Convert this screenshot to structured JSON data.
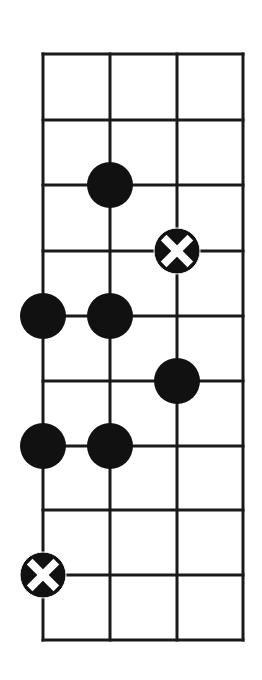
{
  "diagram": {
    "type": "fretboard-scale-diagram",
    "strings": 4,
    "frets": 9,
    "grid": {
      "x_lines": [
        43,
        110,
        177,
        243
      ],
      "y_lines": [
        54,
        120,
        185,
        251,
        316,
        381,
        446,
        510,
        575,
        640
      ],
      "line_color": "#1a1a1a",
      "line_width": 3
    },
    "dot_radius": 23,
    "dot_color": "#111111",
    "marks": [
      {
        "string": 1,
        "line": 2,
        "kind": "filled"
      },
      {
        "string": 2,
        "line": 3,
        "kind": "root-x"
      },
      {
        "string": 0,
        "line": 4,
        "kind": "filled"
      },
      {
        "string": 1,
        "line": 4,
        "kind": "filled"
      },
      {
        "string": 2,
        "line": 5,
        "kind": "filled"
      },
      {
        "string": 0,
        "line": 6,
        "kind": "filled"
      },
      {
        "string": 1,
        "line": 6,
        "kind": "filled"
      },
      {
        "string": 0,
        "line": 8,
        "kind": "root-x"
      }
    ]
  }
}
